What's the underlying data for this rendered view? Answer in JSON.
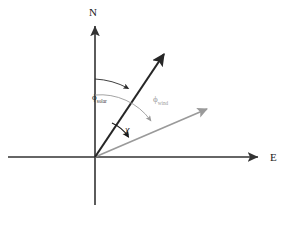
{
  "figure": {
    "background_color": "#ffffff",
    "width": 286,
    "height": 225
  },
  "axes": {
    "north": {
      "label": "N",
      "direction": "up",
      "color": "#333333",
      "origin_x": 95,
      "origin_y": 157,
      "tip_x": 95,
      "tip_y": 22,
      "tail_y": 205,
      "label_x": 89,
      "label_y": 16
    },
    "east": {
      "label": "E",
      "direction": "right",
      "color": "#333333",
      "origin_x": 95,
      "origin_y": 157,
      "tip_x": 262,
      "tip_y": 157,
      "tail_x": 8,
      "label_x": 270,
      "label_y": 161
    }
  },
  "vectors": [
    {
      "name": "solar-vector",
      "color": "#262626",
      "origin_x": 95,
      "origin_y": 157,
      "tip_x": 168,
      "tip_y": 48,
      "angle_from_north_deg": 26.5,
      "stroke_width": 2.1
    },
    {
      "name": "wind-vector",
      "color": "#9a9a9a",
      "origin_x": 95,
      "origin_y": 157,
      "tip_x": 212,
      "tip_y": 107,
      "angle_from_north_deg": 67,
      "stroke_width": 1.7
    }
  ],
  "angles": [
    {
      "name": "solar-azimuth",
      "symbol": "ϕ",
      "subscript": "solar",
      "color": "#2a2a2a",
      "radius": 78,
      "start_deg": 0,
      "end_deg": 26.5,
      "label_x": 92,
      "label_y": 100,
      "stroke_width": 0.9
    },
    {
      "name": "wind-direction-azimuth",
      "symbol": "ϕ",
      "subscript": "wind",
      "color": "#9a9a9a",
      "radius": 62,
      "start_deg": 0,
      "end_deg": 67,
      "label_x": 153,
      "label_y": 102,
      "stroke_width": 0.9
    },
    {
      "name": "chi-angle",
      "symbol": "χ",
      "subscript": "",
      "color": "#1a1a1a",
      "radius": 38,
      "start_deg": 26.5,
      "end_deg": 67,
      "label_x": 125,
      "label_y": 133,
      "stroke_width": 1.1
    }
  ]
}
